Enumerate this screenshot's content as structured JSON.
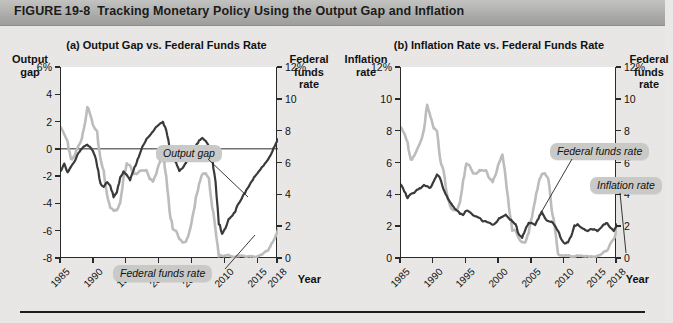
{
  "figure": {
    "label": "FIGURE",
    "number": "19-8",
    "title": "Tracking Monetary Policy Using the Output Gap and Inflation"
  },
  "panel_a": {
    "title": "(a) Output Gap vs. Federal Funds Rate",
    "left_axis_head": [
      "Output",
      "gap"
    ],
    "right_axis_head": [
      "Federal",
      "funds",
      "rate"
    ],
    "x_axis_title": "Year",
    "left_ticks": [
      "6%",
      "4",
      "2",
      "0",
      "-2",
      "-4",
      "-6",
      "-8"
    ],
    "right_ticks": [
      "12%",
      "10",
      "8",
      "6",
      "4",
      "2",
      "0"
    ],
    "x_ticks": [
      "1985",
      "1990",
      "1995",
      "2000",
      "2005",
      "2010",
      "2015",
      "2018"
    ],
    "callouts": [
      {
        "name": "output-gap",
        "text": "Output gap"
      },
      {
        "name": "federal-funds-rate",
        "text": "Federal funds rate"
      }
    ]
  },
  "panel_b": {
    "title": "(b) Inflation Rate vs. Federal Funds Rate",
    "left_axis_head": [
      "Inflation",
      "rate"
    ],
    "right_axis_head": [
      "Federal",
      "funds",
      "rate"
    ],
    "x_axis_title": "Year",
    "left_ticks": [
      "12%",
      "10",
      "8",
      "6",
      "4",
      "2",
      "0"
    ],
    "right_ticks": [
      "12%",
      "10",
      "8",
      "6",
      "4",
      "2",
      "0"
    ],
    "x_ticks": [
      "1985",
      "1990",
      "1995",
      "2000",
      "2005",
      "2010",
      "2015",
      "2018"
    ],
    "callouts": [
      {
        "name": "federal-funds-rate",
        "text": "Federal funds rate"
      },
      {
        "name": "inflation-rate",
        "text": "Inflation rate"
      }
    ]
  },
  "colors": {
    "dark_series": "#3a3a3a",
    "light_series": "#bcbcba",
    "axis": "#2a2a2a",
    "title_bar_top": "#c2c2c0",
    "title_bar_bottom": "#9e9e9c",
    "callout_bg": "#c9c9c7",
    "page_bg": "#e9e8e6",
    "plot_bg": "#ffffff"
  },
  "chart_data": [
    {
      "type": "line",
      "panel": "a",
      "title": "(a) Output Gap vs. Federal Funds Rate",
      "xlabel": "Year",
      "ylabel": "Output gap",
      "y2label": "Federal funds rate",
      "xlim": [
        1985,
        2018
      ],
      "ylim": [
        -8,
        6
      ],
      "y2lim": [
        0,
        12
      ],
      "xticks": [
        1985,
        1990,
        1995,
        2000,
        2005,
        2010,
        2015,
        2018
      ],
      "yticks": [
        -8,
        -6,
        -4,
        -2,
        0,
        2,
        4,
        6
      ],
      "y2ticks": [
        0,
        2,
        4,
        6,
        8,
        10,
        12
      ],
      "grid": false,
      "legend": "callout-labels",
      "series": [
        {
          "name": "Output gap",
          "axis": "left",
          "color": "#3a3a3a",
          "x": [
            1985.0,
            1985.5,
            1986.0,
            1986.5,
            1987.0,
            1987.5,
            1988.0,
            1988.5,
            1989.0,
            1989.5,
            1990.0,
            1990.5,
            1991.0,
            1991.5,
            1992.0,
            1992.5,
            1993.0,
            1993.5,
            1994.0,
            1994.5,
            1995.0,
            1995.5,
            1996.0,
            1996.5,
            1997.0,
            1997.5,
            1998.0,
            1998.5,
            1999.0,
            1999.5,
            2000.0,
            2000.5,
            2001.0,
            2001.5,
            2002.0,
            2002.5,
            2003.0,
            2003.5,
            2004.0,
            2004.5,
            2005.0,
            2005.5,
            2006.0,
            2006.5,
            2007.0,
            2007.5,
            2008.0,
            2008.5,
            2009.0,
            2009.5,
            2010.0,
            2010.5,
            2011.0,
            2011.5,
            2012.0,
            2012.5,
            2013.0,
            2013.5,
            2014.0,
            2014.5,
            2015.0,
            2015.5,
            2016.0,
            2016.5,
            2017.0,
            2017.5,
            2018.0
          ],
          "values": [
            -1.6,
            -1.1,
            -1.8,
            -1.3,
            -1.0,
            -0.4,
            -0.1,
            0.2,
            0.3,
            0.1,
            -0.3,
            -1.2,
            -2.6,
            -2.8,
            -2.4,
            -2.7,
            -3.5,
            -3.2,
            -2.1,
            -1.7,
            -1.9,
            -2.3,
            -1.6,
            -1.0,
            -0.3,
            0.3,
            0.7,
            1.0,
            1.3,
            1.6,
            1.8,
            2.0,
            1.3,
            0.2,
            -0.6,
            -1.0,
            -1.6,
            -1.4,
            -1.0,
            -0.6,
            -0.2,
            0.2,
            0.6,
            0.8,
            0.6,
            0.2,
            -0.6,
            -2.6,
            -5.3,
            -6.2,
            -5.8,
            -5.2,
            -4.9,
            -4.6,
            -4.0,
            -3.6,
            -3.2,
            -2.8,
            -2.4,
            -2.0,
            -1.7,
            -1.4,
            -1.1,
            -0.8,
            -0.3,
            0.2,
            0.7
          ]
        },
        {
          "name": "Federal funds rate",
          "axis": "right",
          "color": "#bcbcba",
          "x": [
            1985.0,
            1985.5,
            1986.0,
            1986.5,
            1987.0,
            1987.5,
            1988.0,
            1988.5,
            1989.0,
            1989.5,
            1990.0,
            1990.5,
            1991.0,
            1991.5,
            1992.0,
            1992.5,
            1993.0,
            1993.5,
            1994.0,
            1994.5,
            1995.0,
            1995.5,
            1996.0,
            1996.5,
            1997.0,
            1997.5,
            1998.0,
            1998.5,
            1999.0,
            1999.5,
            2000.0,
            2000.5,
            2001.0,
            2001.5,
            2002.0,
            2002.5,
            2003.0,
            2003.5,
            2004.0,
            2004.5,
            2005.0,
            2005.5,
            2006.0,
            2006.5,
            2007.0,
            2007.5,
            2008.0,
            2008.5,
            2009.0,
            2009.5,
            2010.0,
            2010.5,
            2011.0,
            2011.5,
            2012.0,
            2012.5,
            2013.0,
            2013.5,
            2014.0,
            2014.5,
            2015.0,
            2015.5,
            2016.0,
            2016.5,
            2017.0,
            2017.5,
            2018.0
          ],
          "values": [
            8.2,
            7.8,
            7.3,
            6.1,
            6.4,
            6.9,
            7.3,
            8.1,
            9.6,
            8.9,
            8.2,
            8.0,
            6.1,
            5.5,
            4.0,
            3.2,
            3.0,
            3.0,
            3.5,
            4.9,
            5.9,
            5.8,
            5.3,
            5.3,
            5.5,
            5.5,
            5.5,
            5.0,
            4.8,
            5.3,
            6.0,
            6.5,
            5.0,
            3.0,
            1.8,
            1.7,
            1.2,
            1.0,
            1.0,
            1.6,
            2.6,
            3.7,
            4.7,
            5.3,
            5.3,
            5.0,
            3.2,
            1.9,
            0.2,
            0.15,
            0.15,
            0.18,
            0.1,
            0.08,
            0.14,
            0.16,
            0.1,
            0.09,
            0.09,
            0.09,
            0.12,
            0.2,
            0.4,
            0.45,
            0.9,
            1.2,
            1.8
          ]
        }
      ]
    },
    {
      "type": "line",
      "panel": "b",
      "title": "(b) Inflation Rate vs. Federal Funds Rate",
      "xlabel": "Year",
      "ylabel": "Inflation rate",
      "y2label": "Federal funds rate",
      "xlim": [
        1985,
        2018
      ],
      "ylim": [
        0,
        12
      ],
      "y2lim": [
        0,
        12
      ],
      "xticks": [
        1985,
        1990,
        1995,
        2000,
        2005,
        2010,
        2015,
        2018
      ],
      "yticks": [
        0,
        2,
        4,
        6,
        8,
        10,
        12
      ],
      "y2ticks": [
        0,
        2,
        4,
        6,
        8,
        10,
        12
      ],
      "grid": false,
      "legend": "callout-labels",
      "series": [
        {
          "name": "Inflation rate",
          "axis": "left",
          "color": "#3a3a3a",
          "x": [
            1985.0,
            1985.5,
            1986.0,
            1986.5,
            1987.0,
            1987.5,
            1988.0,
            1988.5,
            1989.0,
            1989.5,
            1990.0,
            1990.5,
            1991.0,
            1991.5,
            1992.0,
            1992.5,
            1993.0,
            1993.5,
            1994.0,
            1994.5,
            1995.0,
            1995.5,
            1996.0,
            1996.5,
            1997.0,
            1997.5,
            1998.0,
            1998.5,
            1999.0,
            1999.5,
            2000.0,
            2000.5,
            2001.0,
            2001.5,
            2002.0,
            2002.5,
            2003.0,
            2003.5,
            2004.0,
            2004.5,
            2005.0,
            2005.5,
            2006.0,
            2006.5,
            2007.0,
            2007.5,
            2008.0,
            2008.5,
            2009.0,
            2009.5,
            2010.0,
            2010.5,
            2011.0,
            2011.5,
            2012.0,
            2012.5,
            2013.0,
            2013.5,
            2014.0,
            2014.5,
            2015.0,
            2015.5,
            2016.0,
            2016.5,
            2017.0,
            2017.5,
            2018.0
          ],
          "values": [
            4.6,
            4.2,
            3.8,
            4.0,
            4.1,
            4.3,
            4.4,
            4.6,
            4.5,
            4.4,
            4.8,
            5.3,
            5.0,
            4.3,
            3.9,
            3.5,
            3.2,
            3.0,
            2.8,
            2.7,
            3.0,
            2.9,
            2.7,
            2.6,
            2.5,
            2.3,
            2.3,
            2.2,
            2.1,
            2.2,
            2.5,
            2.6,
            2.7,
            2.5,
            2.3,
            2.1,
            1.5,
            1.3,
            1.8,
            2.2,
            2.2,
            2.1,
            2.5,
            2.9,
            2.5,
            2.3,
            2.3,
            2.0,
            1.7,
            1.2,
            0.9,
            1.0,
            1.4,
            2.0,
            2.1,
            1.9,
            1.8,
            1.7,
            1.8,
            1.8,
            1.7,
            1.9,
            2.1,
            2.2,
            1.9,
            1.7,
            2.1
          ]
        },
        {
          "name": "Federal funds rate",
          "axis": "right",
          "color": "#bcbcba",
          "x": [
            1985.0,
            1985.5,
            1986.0,
            1986.5,
            1987.0,
            1987.5,
            1988.0,
            1988.5,
            1989.0,
            1989.5,
            1990.0,
            1990.5,
            1991.0,
            1991.5,
            1992.0,
            1992.5,
            1993.0,
            1993.5,
            1994.0,
            1994.5,
            1995.0,
            1995.5,
            1996.0,
            1996.5,
            1997.0,
            1997.5,
            1998.0,
            1998.5,
            1999.0,
            1999.5,
            2000.0,
            2000.5,
            2001.0,
            2001.5,
            2002.0,
            2002.5,
            2003.0,
            2003.5,
            2004.0,
            2004.5,
            2005.0,
            2005.5,
            2006.0,
            2006.5,
            2007.0,
            2007.5,
            2008.0,
            2008.5,
            2009.0,
            2009.5,
            2010.0,
            2010.5,
            2011.0,
            2011.5,
            2012.0,
            2012.5,
            2013.0,
            2013.5,
            2014.0,
            2014.5,
            2015.0,
            2015.5,
            2016.0,
            2016.5,
            2017.0,
            2017.5,
            2018.0
          ],
          "values": [
            8.2,
            7.8,
            7.3,
            6.1,
            6.4,
            6.9,
            7.3,
            8.1,
            9.6,
            8.9,
            8.2,
            8.0,
            6.1,
            5.5,
            4.0,
            3.2,
            3.0,
            3.0,
            3.5,
            4.9,
            5.9,
            5.8,
            5.3,
            5.3,
            5.5,
            5.5,
            5.5,
            5.0,
            4.8,
            5.3,
            6.0,
            6.5,
            5.0,
            3.0,
            1.8,
            1.7,
            1.2,
            1.0,
            1.0,
            1.6,
            2.6,
            3.7,
            4.7,
            5.3,
            5.3,
            5.0,
            3.2,
            1.9,
            0.2,
            0.15,
            0.15,
            0.18,
            0.1,
            0.08,
            0.14,
            0.16,
            0.1,
            0.09,
            0.09,
            0.09,
            0.12,
            0.2,
            0.4,
            0.45,
            0.9,
            1.2,
            1.8
          ]
        }
      ]
    }
  ]
}
